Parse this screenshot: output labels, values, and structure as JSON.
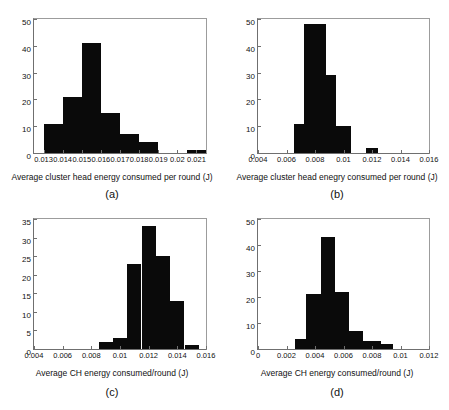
{
  "figure": {
    "title": "",
    "panels": [
      "a",
      "b",
      "c",
      "d"
    ]
  },
  "panels": {
    "a": {
      "caption": "(a)",
      "xlabel": "Average cluster head energy consumed per round (J)",
      "ylabel": "",
      "xticklabels": [
        "0.013",
        "0.014",
        "0.015",
        "0.016",
        "0.017",
        "0.018",
        "0.019",
        "0.02",
        "0.021"
      ],
      "yticklabels": [
        "0",
        "10",
        "20",
        "30",
        "40",
        "50"
      ]
    },
    "b": {
      "caption": "(b)",
      "xlabel": "Average cluster head enegry consumed per round (J)",
      "ylabel": "",
      "xticklabels": [
        "0.004",
        "0.006",
        "0.008",
        "0.01",
        "0.012",
        "0.014",
        "0.016"
      ],
      "yticklabels": [
        "0",
        "10",
        "20",
        "30",
        "40",
        "50"
      ]
    },
    "c": {
      "caption": "(c)",
      "xlabel": "Average CH energy consumed/round (J)",
      "ylabel": "",
      "xticklabels": [
        "0.004",
        "0.006",
        "0.008",
        "0.01",
        "0.012",
        "0.014",
        "0.016"
      ],
      "yticklabels": [
        "0",
        "5",
        "10",
        "15",
        "20",
        "25",
        "30",
        "35"
      ]
    },
    "d": {
      "caption": "(d)",
      "xlabel": "Average CH energy consumed/round (J)",
      "ylabel": "",
      "xticklabels": [
        "0",
        "0.002",
        "0.004",
        "0.006",
        "0.008",
        "0.01",
        "0.012"
      ],
      "yticklabels": [
        "0",
        "10",
        "20",
        "30",
        "40",
        "50"
      ]
    }
  },
  "chart_data": [
    {
      "panel": "a",
      "type": "bar",
      "title": "(a)",
      "xlabel": "Average cluster head energy consumed per round (J)",
      "ylabel": "",
      "xlim": [
        0.0125,
        0.0215
      ],
      "ylim": [
        0,
        50
      ],
      "yticks": [
        0,
        10,
        20,
        30,
        40,
        50
      ],
      "xticks": [
        0.013,
        0.014,
        0.015,
        0.016,
        0.017,
        0.018,
        0.019,
        0.02,
        0.021
      ],
      "grid": false,
      "bar_color": "#0a0a0a",
      "bins": [
        {
          "left": 0.013,
          "right": 0.014,
          "count": 11
        },
        {
          "left": 0.014,
          "right": 0.015,
          "count": 21
        },
        {
          "left": 0.015,
          "right": 0.016,
          "count": 41
        },
        {
          "left": 0.016,
          "right": 0.017,
          "count": 15
        },
        {
          "left": 0.017,
          "right": 0.018,
          "count": 7
        },
        {
          "left": 0.018,
          "right": 0.019,
          "count": 4
        },
        {
          "left": 0.0205,
          "right": 0.0215,
          "count": 1
        }
      ]
    },
    {
      "panel": "b",
      "type": "bar",
      "title": "(b)",
      "xlabel": "Average cluster head enegry consumed per round (J)",
      "ylabel": "",
      "xlim": [
        0.004,
        0.016
      ],
      "ylim": [
        0,
        50
      ],
      "yticks": [
        0,
        10,
        20,
        30,
        40,
        50
      ],
      "xticks": [
        0.004,
        0.006,
        0.008,
        0.01,
        0.012,
        0.014,
        0.016
      ],
      "grid": false,
      "bar_color": "#0a0a0a",
      "bins": [
        {
          "left": 0.0065,
          "right": 0.00725,
          "count": 11
        },
        {
          "left": 0.00725,
          "right": 0.00875,
          "count": 48
        },
        {
          "left": 0.00875,
          "right": 0.0095,
          "count": 29
        },
        {
          "left": 0.0095,
          "right": 0.0105,
          "count": 10
        },
        {
          "left": 0.0116,
          "right": 0.0124,
          "count": 2
        }
      ]
    },
    {
      "panel": "c",
      "type": "bar",
      "title": "(c)",
      "xlabel": "Average CH energy consumed/round (J)",
      "ylabel": "",
      "xlim": [
        0.004,
        0.016
      ],
      "ylim": [
        0,
        35
      ],
      "yticks": [
        0,
        5,
        10,
        15,
        20,
        25,
        30,
        35
      ],
      "xticks": [
        0.004,
        0.006,
        0.008,
        0.01,
        0.012,
        0.014,
        0.016
      ],
      "grid": false,
      "bar_color": "#0a0a0a",
      "bins": [
        {
          "left": 0.0085,
          "right": 0.0095,
          "count": 2
        },
        {
          "left": 0.0095,
          "right": 0.0105,
          "count": 3
        },
        {
          "left": 0.0105,
          "right": 0.0115,
          "count": 23
        },
        {
          "left": 0.0115,
          "right": 0.0125,
          "count": 33
        },
        {
          "left": 0.0125,
          "right": 0.0135,
          "count": 25
        },
        {
          "left": 0.0135,
          "right": 0.0145,
          "count": 13
        },
        {
          "left": 0.0145,
          "right": 0.0155,
          "count": 1
        }
      ]
    },
    {
      "panel": "d",
      "type": "bar",
      "title": "(d)",
      "xlabel": "Average CH energy consumed/round (J)",
      "ylabel": "",
      "xlim": [
        0,
        0.012
      ],
      "ylim": [
        0,
        50
      ],
      "yticks": [
        0,
        10,
        20,
        30,
        40,
        50
      ],
      "xticks": [
        0,
        0.002,
        0.004,
        0.006,
        0.008,
        0.01,
        0.012
      ],
      "grid": false,
      "bar_color": "#0a0a0a",
      "bins": [
        {
          "left": 0.0026,
          "right": 0.0034,
          "count": 4
        },
        {
          "left": 0.0034,
          "right": 0.0044,
          "count": 21
        },
        {
          "left": 0.0044,
          "right": 0.0054,
          "count": 43
        },
        {
          "left": 0.0054,
          "right": 0.0064,
          "count": 22
        },
        {
          "left": 0.0064,
          "right": 0.0074,
          "count": 7
        },
        {
          "left": 0.0074,
          "right": 0.0086,
          "count": 3
        },
        {
          "left": 0.0086,
          "right": 0.0095,
          "count": 2
        }
      ]
    }
  ]
}
